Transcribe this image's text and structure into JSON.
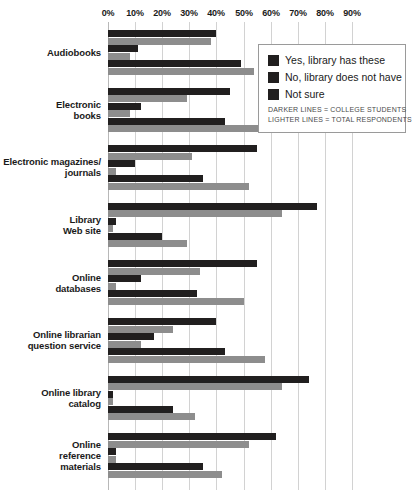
{
  "chart_data": {
    "type": "bar",
    "orientation": "horizontal",
    "title": "",
    "xlabel": "",
    "ylabel": "",
    "xlim": [
      0,
      95
    ],
    "grid": true,
    "grid_axis": "x",
    "legend_position": "top-right",
    "tick_labels": [
      "0%",
      "10%",
      "20%",
      "30%",
      "40%",
      "50%",
      "60%",
      "70%",
      "80%",
      "90%"
    ],
    "tick_values": [
      0,
      10,
      20,
      30,
      40,
      50,
      60,
      70,
      80,
      90
    ],
    "categories": [
      "Audiobooks",
      "Electronic\nbooks",
      "Electronic magazines/\njournals",
      "Library\nWeb site",
      "Online\ndatabases",
      "Online librarian\nquestion service",
      "Online library\ncatalog",
      "Online\nreference\nmaterials"
    ],
    "category_lines": [
      [
        "Audiobooks"
      ],
      [
        "Electronic",
        "books"
      ],
      [
        "Electronic magazines/",
        "journals"
      ],
      [
        "Library",
        "Web site"
      ],
      [
        "Online",
        "databases"
      ],
      [
        "Online librarian",
        "question service"
      ],
      [
        "Online library",
        "catalog"
      ],
      [
        "Online",
        "reference",
        "materials"
      ]
    ],
    "series": [
      {
        "name": "Yes, library has these — College students",
        "group": "college",
        "answer": "yes",
        "color": "#211f1f",
        "values": [
          40,
          45,
          55,
          77,
          55,
          40,
          74,
          62
        ]
      },
      {
        "name": "Yes, library has these — Total respondents",
        "group": "total",
        "answer": "yes",
        "color": "#8d8d8d",
        "values": [
          38,
          29,
          31,
          64,
          34,
          24,
          64,
          52
        ]
      },
      {
        "name": "No, library does not have — College students",
        "group": "college",
        "answer": "no",
        "color": "#211f1f",
        "values": [
          11,
          12,
          10,
          3,
          12,
          17,
          2,
          3
        ]
      },
      {
        "name": "No, library does not have — Total respondents",
        "group": "total",
        "answer": "no",
        "color": "#8d8d8d",
        "values": [
          8,
          8,
          3,
          2,
          3,
          12,
          2,
          3
        ]
      },
      {
        "name": "Not sure — College students",
        "group": "college",
        "answer": "not_sure",
        "color": "#211f1f",
        "values": [
          49,
          43,
          35,
          20,
          33,
          43,
          24,
          35
        ]
      },
      {
        "name": "Not sure — Total respondents",
        "group": "total",
        "answer": "not_sure",
        "color": "#8d8d8d",
        "values": [
          54,
          59,
          52,
          29,
          50,
          58,
          32,
          42
        ]
      }
    ]
  },
  "legend": {
    "items": [
      {
        "label": "Yes, library has these",
        "color": "#211f1f"
      },
      {
        "label": "No, library does not have",
        "color": "#211f1f"
      },
      {
        "label": "Not sure",
        "color": "#211f1f"
      }
    ],
    "notes": [
      "DARKER LINES = COLLEGE STUDENTS",
      "LIGHTER LINES = TOTAL RESPONDENTS"
    ]
  }
}
